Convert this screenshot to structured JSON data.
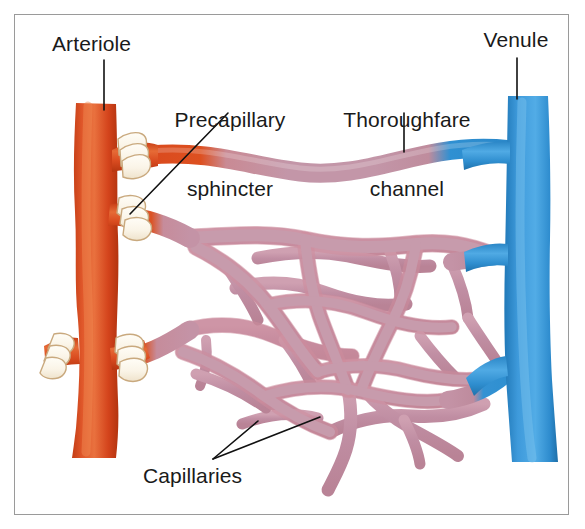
{
  "figure": {
    "kind": "anatomical-illustration",
    "background_color": "#ffffff",
    "frame_color": "#9a9a9a"
  },
  "labels": {
    "arteriole": "Arteriole",
    "precapillary_sphincter_line1": "Precapillary",
    "precapillary_sphincter_line2": "sphincter",
    "thoroughfare_channel_line1": "Thoroughfare",
    "thoroughfare_channel_line2": "channel",
    "venule": "Venule",
    "capillaries": "Capillaries"
  },
  "colors": {
    "arteriole": "#D8481F",
    "arteriole_light": "#E86B38",
    "arteriole_dark": "#B93A15",
    "venule": "#2E90D2",
    "venule_light": "#57AEE4",
    "venule_dark": "#1F74B0",
    "capillary": "#C493A6",
    "capillary_light": "#D7AEBC",
    "capillary_edge": "#C9808F",
    "sphincter": "#FBF6EB",
    "sphincter_edge": "#C9A97E",
    "leader_line": "#111111",
    "text": "#1a1a1a"
  },
  "structures": [
    {
      "name": "arteriole-trunk",
      "type": "vessel",
      "color_key": "arteriole",
      "orientation": "vertical",
      "side": "left"
    },
    {
      "name": "arteriole-branch-upper",
      "type": "vessel",
      "color_key": "arteriole",
      "side": "left"
    },
    {
      "name": "arteriole-branch-middle",
      "type": "vessel",
      "color_key": "arteriole",
      "side": "left"
    },
    {
      "name": "arteriole-branch-lower",
      "type": "vessel",
      "color_key": "arteriole",
      "side": "left"
    },
    {
      "name": "arteriole-stub-left",
      "type": "vessel",
      "color_key": "arteriole",
      "side": "left"
    },
    {
      "name": "precapillary-sphincter-upper",
      "type": "sphincter",
      "color_key": "sphincter"
    },
    {
      "name": "precapillary-sphincter-middle",
      "type": "sphincter",
      "color_key": "sphincter"
    },
    {
      "name": "precapillary-sphincter-lower",
      "type": "sphincter",
      "color_key": "sphincter"
    },
    {
      "name": "precapillary-sphincter-stub",
      "type": "sphincter",
      "color_key": "sphincter"
    },
    {
      "name": "thoroughfare-channel",
      "type": "vessel",
      "gradient": [
        "arteriole",
        "capillary",
        "venule"
      ]
    },
    {
      "name": "capillary-network",
      "type": "anastomosing-network",
      "color_key": "capillary"
    },
    {
      "name": "venule-trunk",
      "type": "vessel",
      "color_key": "venule",
      "orientation": "vertical",
      "side": "right"
    },
    {
      "name": "venule-branch-upper",
      "type": "vessel",
      "color_key": "venule",
      "side": "right"
    },
    {
      "name": "venule-branch-middle",
      "type": "vessel",
      "color_key": "venule",
      "side": "right"
    },
    {
      "name": "venule-branch-lower",
      "type": "vessel",
      "color_key": "venule",
      "side": "right"
    }
  ],
  "leader_lines": [
    {
      "name": "leader-arteriole",
      "from_label": "arteriole",
      "points": "104,60 104,108"
    },
    {
      "name": "leader-precapillary-sphincter",
      "from_label": "precapillary_sphincter",
      "points": "228,113 130,213"
    },
    {
      "name": "leader-thoroughfare-channel",
      "from_label": "thoroughfare_channel",
      "points": "404,113 404,152"
    },
    {
      "name": "leader-venule",
      "from_label": "venule",
      "points": "517,58 517,97"
    },
    {
      "name": "leader-capillaries-a",
      "from_label": "capillaries",
      "points": "213,459 257,421"
    },
    {
      "name": "leader-capillaries-b",
      "from_label": "capillaries",
      "points": "213,459 318,418"
    }
  ]
}
